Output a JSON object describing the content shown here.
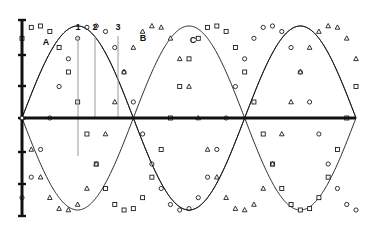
{
  "figure": {
    "title": "",
    "background_color": "#ffffff",
    "ink_color": "#111111",
    "guide_color": "#9a9a9a"
  },
  "axes": {
    "y_axis": {
      "x_px": 22,
      "top_px": 20,
      "bottom_px": 216,
      "zero_px": 118,
      "stroke_width": 3,
      "ticks_px": [
        20,
        55,
        86,
        118,
        152,
        184,
        216
      ],
      "tick_labels": [
        "",
        "",
        "",
        "0",
        "",
        "",
        ""
      ]
    },
    "x_axis": {
      "y_px": 118,
      "left_px": 22,
      "right_px": 356,
      "stroke_width": 3
    }
  },
  "annotations": {
    "phase_labels": [
      {
        "text": "A",
        "x_px": 46,
        "y_px": 45
      },
      {
        "text": "B",
        "x_px": 143,
        "y_px": 41
      },
      {
        "text": "C",
        "x_px": 193,
        "y_px": 43
      }
    ],
    "numbered_labels": [
      {
        "text": "1",
        "x_px": 78,
        "y_px": 30
      },
      {
        "text": "2",
        "x_px": 95,
        "y_px": 30
      },
      {
        "text": "3",
        "x_px": 118,
        "y_px": 30
      }
    ],
    "vertical_guides": [
      {
        "name": "1",
        "x_px": 78,
        "top_px": 36,
        "bottom_px": 156
      },
      {
        "name": "2",
        "x_px": 95,
        "top_px": 36,
        "bottom_px": 118
      },
      {
        "name": "3",
        "x_px": 118,
        "top_px": 36,
        "bottom_px": 118
      }
    ]
  },
  "chart_data": {
    "type": "line",
    "title": "",
    "xlabel": "",
    "ylabel": "",
    "grid": false,
    "legend_position": "none",
    "xlim": [
      0,
      360
    ],
    "ylim": [
      -1.05,
      1.05
    ],
    "x_unit": "degrees",
    "series": [
      {
        "name": "phase-1",
        "marker": "square",
        "phase_deg": 120,
        "amplitude": 1.0,
        "period_deg": 240,
        "x": [
          0,
          10,
          20,
          30,
          40,
          50,
          60,
          70,
          80,
          90,
          100,
          110,
          120,
          130,
          140,
          150,
          160,
          170,
          180,
          190,
          200,
          210,
          220,
          230,
          240,
          250,
          260,
          270,
          280,
          290,
          300,
          310,
          320,
          330,
          340,
          350,
          360
        ],
        "values": [
          0.866,
          0.985,
          1.0,
          0.94,
          0.766,
          0.5,
          0.174,
          -0.174,
          -0.5,
          -0.766,
          -0.94,
          -1.0,
          -0.985,
          -0.866,
          -0.643,
          -0.342,
          0.0,
          0.342,
          0.643,
          0.866,
          0.985,
          1.0,
          0.94,
          0.766,
          0.5,
          0.174,
          -0.174,
          -0.5,
          -0.766,
          -0.94,
          -1.0,
          -0.985,
          -0.866,
          -0.643,
          -0.342,
          0.0,
          0.342
        ]
      },
      {
        "name": "phase-2",
        "marker": "circle",
        "phase_deg": 0,
        "amplitude": 1.0,
        "period_deg": 240,
        "x": [
          0,
          10,
          20,
          30,
          40,
          50,
          60,
          70,
          80,
          90,
          100,
          110,
          120,
          130,
          140,
          150,
          160,
          170,
          180,
          190,
          200,
          210,
          220,
          230,
          240,
          250,
          260,
          270,
          280,
          290,
          300,
          310,
          320,
          330,
          340,
          350,
          360
        ],
        "values": [
          -0.866,
          -0.643,
          -0.342,
          0.0,
          0.342,
          0.643,
          0.866,
          0.985,
          1.0,
          0.94,
          0.766,
          0.5,
          0.174,
          -0.174,
          -0.5,
          -0.766,
          -0.94,
          -1.0,
          -0.985,
          -0.866,
          -0.643,
          -0.342,
          0.0,
          0.342,
          0.643,
          0.866,
          0.985,
          1.0,
          0.94,
          0.766,
          0.5,
          0.174,
          -0.174,
          -0.5,
          -0.766,
          -0.94,
          -1.0
        ]
      },
      {
        "name": "phase-3",
        "marker": "triangle",
        "phase_deg": 240,
        "amplitude": 1.0,
        "period_deg": 240,
        "x": [
          0,
          10,
          20,
          30,
          40,
          50,
          60,
          70,
          80,
          90,
          100,
          110,
          120,
          130,
          140,
          150,
          160,
          170,
          180,
          190,
          200,
          210,
          220,
          230,
          240,
          250,
          260,
          270,
          280,
          290,
          300,
          310,
          320,
          330,
          340,
          350,
          360
        ],
        "values": [
          0.0,
          -0.342,
          -0.643,
          -0.866,
          -0.985,
          -1.0,
          -0.94,
          -0.766,
          -0.5,
          -0.174,
          0.174,
          0.5,
          0.766,
          0.94,
          1.0,
          0.985,
          0.866,
          0.643,
          0.342,
          0.0,
          -0.342,
          -0.643,
          -0.866,
          -0.985,
          -1.0,
          -0.94,
          -0.766,
          -0.5,
          -0.174,
          0.174,
          0.5,
          0.766,
          0.94,
          1.0,
          0.985,
          0.866,
          0.643
        ]
      }
    ]
  }
}
